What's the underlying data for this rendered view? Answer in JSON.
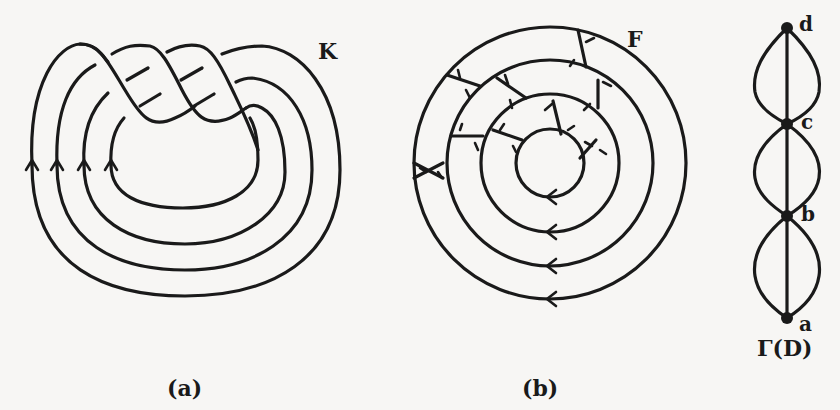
{
  "figure": {
    "panel_a": {
      "caption": "(a)",
      "knot_label": "K"
    },
    "panel_b": {
      "caption": "(b)",
      "surface_label": "F"
    },
    "panel_c": {
      "caption": "Γ(D)",
      "vertices": [
        {
          "id": "d",
          "label": "d"
        },
        {
          "id": "c",
          "label": "c"
        },
        {
          "id": "b",
          "label": "b"
        },
        {
          "id": "a",
          "label": "a"
        }
      ]
    }
  },
  "colors": {
    "ink": "#1a1a1a",
    "paper": "#f7f6f4"
  }
}
